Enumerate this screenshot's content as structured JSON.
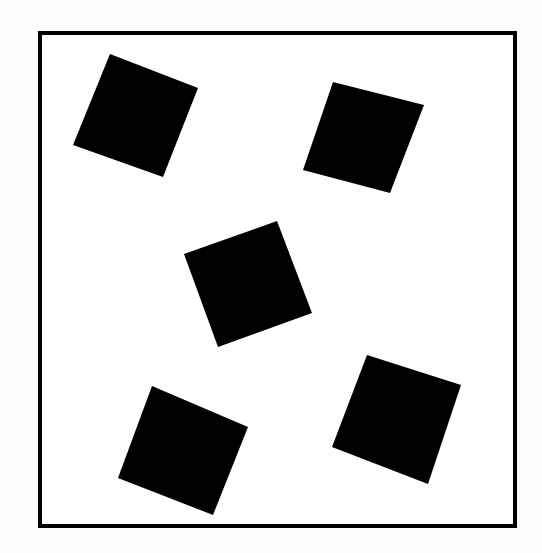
{
  "figure": {
    "title": "Five rotated black squares inside a square frame",
    "canvas": {
      "width": 542,
      "height": 553,
      "background_color": "#fdfdfc"
    },
    "frame": {
      "name": "outer-square-border",
      "stroke_color": "#000000",
      "fill_color": "#ffffff",
      "stroke_width": 4,
      "x": 38,
      "y": 31,
      "width": 479,
      "height": 497
    },
    "shape_color": "#000000",
    "shape_count": 5,
    "shapes": [
      {
        "id": "square-top-left",
        "label": "Top-left square",
        "fill": "#000000",
        "side": 95,
        "rotation_deg": 21,
        "center": [
          136,
          116
        ],
        "points": "110,54 198,88 163,177 73,145"
      },
      {
        "id": "square-top-right",
        "label": "Top-right square",
        "fill": "#000000",
        "side": 94,
        "rotation_deg": 14,
        "center": [
          363,
          137
        ],
        "points": "333,82 424,105 390,193 303,170"
      },
      {
        "id": "square-center",
        "label": "Center square",
        "fill": "#000000",
        "side": 97,
        "rotation_deg": 27,
        "center": [
          248,
          284
        ],
        "points": "277,221 312,313 218,347 184,254"
      },
      {
        "id": "square-bottom-left",
        "label": "Bottom-left square",
        "fill": "#000000",
        "side": 104,
        "rotation_deg": 23,
        "center": [
          183,
          451
        ],
        "points": "152,386 248,427 213,515 118,478"
      },
      {
        "id": "square-bottom-right",
        "label": "Bottom-right square",
        "fill": "#000000",
        "side": 101,
        "rotation_deg": 18,
        "center": [
          397,
          419
        ],
        "points": "367,355 461,385 428,484 332,447"
      }
    ]
  }
}
